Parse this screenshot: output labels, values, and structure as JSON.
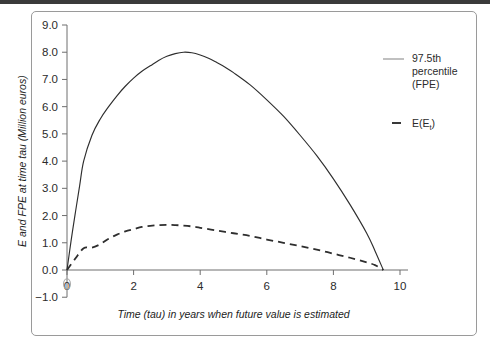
{
  "figure": {
    "border_color": "#9a9a9a",
    "top_band_color": "#3a3a3a",
    "background": "#ffffff"
  },
  "legend": {
    "position": "right",
    "entries": [
      {
        "name": "97.5th percentile (FPE)",
        "line1": "97.5th",
        "line2": "percentile",
        "line3": "(FPE)",
        "style": "solid",
        "color": "#8c8c8c"
      },
      {
        "name": "E(Et)",
        "base": "E(E",
        "subscript": "t",
        "close": ")",
        "style": "dashed",
        "color": "#2e2e2e"
      }
    ]
  },
  "chart_data": {
    "type": "line",
    "title": "",
    "xlabel": "Time (tau) in years when future value is estimated",
    "ylabel": "E and FPE at time tau (Million euros)",
    "xlim": [
      0,
      10.4
    ],
    "ylim": [
      -1.0,
      9.0
    ],
    "xticks": [
      0,
      2,
      4,
      6,
      8,
      10
    ],
    "xticklabels": [
      "0",
      "2",
      "4",
      "6",
      "8",
      "10"
    ],
    "yticks": [
      -1.0,
      0.0,
      1.0,
      2.0,
      3.0,
      4.0,
      5.0,
      6.0,
      7.0,
      8.0,
      9.0
    ],
    "yticklabels": [
      "-1.0",
      "0.0",
      "1.0",
      "2.0",
      "3.0",
      "4.0",
      "5.0",
      "6.0",
      "7.0",
      "8.0",
      "9.0"
    ],
    "grid": false,
    "series": [
      {
        "name": "97.5th percentile (FPE)",
        "style": "solid",
        "color": "#2e2e2e",
        "x": [
          0.0,
          0.12,
          0.25,
          0.38,
          0.5,
          0.75,
          1.0,
          1.25,
          1.5,
          1.75,
          2.0,
          2.25,
          2.5,
          2.75,
          3.0,
          3.25,
          3.5,
          3.75,
          4.0,
          4.25,
          4.5,
          4.75,
          5.0,
          5.5,
          6.0,
          6.5,
          7.0,
          7.5,
          8.0,
          8.5,
          9.0,
          9.25,
          9.5
        ],
        "y": [
          0.0,
          1.05,
          2.1,
          3.1,
          4.0,
          4.95,
          5.55,
          6.0,
          6.4,
          6.75,
          7.05,
          7.3,
          7.5,
          7.7,
          7.85,
          7.95,
          8.0,
          7.98,
          7.9,
          7.78,
          7.62,
          7.45,
          7.25,
          6.8,
          6.25,
          5.65,
          4.95,
          4.2,
          3.35,
          2.4,
          1.35,
          0.7,
          0.0
        ]
      },
      {
        "name": "E(Et)",
        "style": "dashed",
        "color": "#2e2e2e",
        "x": [
          0.0,
          0.25,
          0.5,
          0.75,
          1.0,
          1.25,
          1.5,
          1.75,
          2.0,
          2.25,
          2.5,
          2.75,
          3.0,
          3.25,
          3.5,
          3.75,
          4.0,
          4.5,
          5.0,
          5.5,
          6.0,
          6.5,
          7.0,
          7.5,
          8.0,
          8.5,
          9.0,
          9.25,
          9.5
        ],
        "y": [
          0.0,
          0.42,
          0.8,
          0.82,
          0.95,
          1.15,
          1.3,
          1.42,
          1.5,
          1.58,
          1.62,
          1.65,
          1.66,
          1.65,
          1.63,
          1.6,
          1.55,
          1.45,
          1.35,
          1.25,
          1.12,
          1.0,
          0.88,
          0.75,
          0.6,
          0.45,
          0.28,
          0.18,
          0.0
        ]
      }
    ]
  }
}
